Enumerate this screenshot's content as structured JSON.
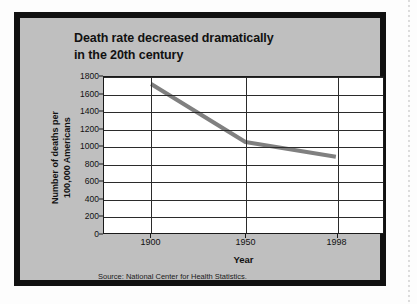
{
  "figure": {
    "title_line1": "Death rate decreased dramatically",
    "title_line2": "in the 20th century",
    "source_note": "Source: National Center for Health Statistics.",
    "background_color": "#bfbfbf",
    "frame_color": "#111111",
    "plot_background_color": "#ffffff",
    "series_color": "#808080"
  },
  "axes": {
    "y_title_line1": "Number of deaths per",
    "y_title_line2": "100,000 Americans",
    "x_title": "Year",
    "y_ticks": [
      "0",
      "200",
      "400",
      "600",
      "800",
      "1000",
      "1200",
      "1400",
      "1600",
      "1800"
    ],
    "x_ticks": [
      "1900",
      "1950",
      "1998"
    ]
  },
  "chart_data": {
    "type": "line",
    "title": "Death rate decreased dramatically in the 20th century",
    "xlabel": "Year",
    "ylabel": "Number of deaths per 100,000 Americans",
    "x": [
      1900,
      1950,
      1998
    ],
    "values": [
      1720,
      1050,
      880
    ],
    "series": [
      {
        "name": "Death rate per 100,000 Americans",
        "x": [
          1900,
          1950,
          1998
        ],
        "values": [
          1720,
          1050,
          880
        ]
      }
    ],
    "xlim": [
      1875,
      2023
    ],
    "ylim": [
      0,
      1800
    ],
    "ytick_values": [
      0,
      200,
      400,
      600,
      800,
      1000,
      1200,
      1400,
      1600,
      1800
    ],
    "xtick_values": [
      1900,
      1950,
      1998
    ],
    "grid": "horizontal-and-vertical-at-ticks",
    "legend": "none",
    "annotations": [
      "Source: National Center for Health Statistics."
    ]
  }
}
